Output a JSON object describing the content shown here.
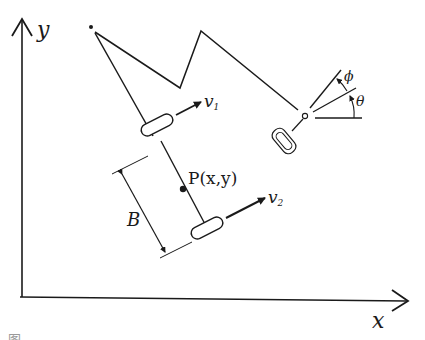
{
  "figure": {
    "axes": {
      "x_label": "x",
      "y_label": "y"
    },
    "labels": {
      "wheel1_velocity": "v",
      "wheel1_velocity_sub": "1",
      "wheel2_velocity": "v",
      "wheel2_velocity_sub": "2",
      "center_point": "P(x,y)",
      "wheelbase": "B",
      "steer_angle": "ϕ",
      "heading_angle": "θ"
    },
    "caption": "图"
  },
  "colors": {
    "ink": "#1a1a1a",
    "background": "#ffffff"
  }
}
